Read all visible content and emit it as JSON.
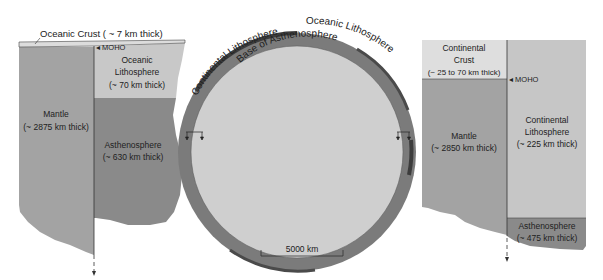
{
  "colors": {
    "crust_oceanic": "#dcdcdc",
    "lithosphere_light": "#c8c8c8",
    "mantle": "#a3a3a3",
    "asthenosphere": "#8a8a8a",
    "continental_crust": "#dedede",
    "continental_lithosphere": "#c6c6c6",
    "ring_dark": "#5a5a5a",
    "ring_mid": "#7b7b7b",
    "core": "#cfcfcf"
  },
  "left_column": {
    "crust_label": "Oceanic Crust ( ~ 7 km thick)",
    "moho_label": "◂ MOHO",
    "mantle": {
      "name": "Mantle",
      "thickness": "(~ 2875 km thick)"
    },
    "lithosphere": {
      "name_line1": "Oceanic",
      "name_line2": "Lithosphere",
      "thickness": "(~ 70 km thick)"
    },
    "asthenosphere": {
      "name": "Asthenosphere",
      "thickness": "(~ 630 km thick)"
    }
  },
  "globe": {
    "arc_labels": {
      "continental": "Continental Lithosphere",
      "oceanic": "Oceanic Lithosphere",
      "base": "Base of Asthenosphere"
    },
    "scale_bar": "5000 km"
  },
  "right_column": {
    "crust": {
      "name_line1": "Continental",
      "name_line2": "Crust",
      "thickness": "(~ 25 to 70 km thick)"
    },
    "moho_label": "◂ MOHO",
    "mantle": {
      "name": "Mantle",
      "thickness": "(~ 2850 km thick)"
    },
    "lithosphere": {
      "name_line1": "Continental",
      "name_line2": "Lithosphere",
      "thickness": "(~ 225 km thick)"
    },
    "asthenosphere": {
      "name": "Asthenosphere",
      "thickness": "(~ 475 km thick)"
    }
  }
}
